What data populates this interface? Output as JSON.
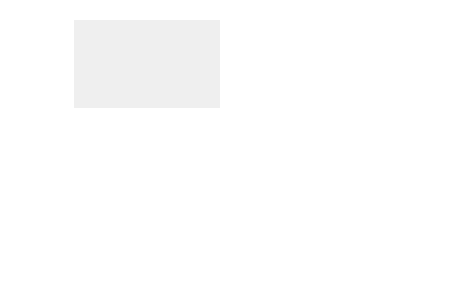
{
  "axes": {
    "y_label": "Effect size",
    "x_label": "Allele frequency",
    "y_ticks": [
      "Large",
      "Moderate",
      "Small"
    ],
    "x_ticks": [
      "Very rare",
      "Rare",
      "Low",
      "Common"
    ]
  },
  "groups": [
    {
      "title": "Mendelian loci",
      "line2": "Very low frequency",
      "line3": "Highly penetrant",
      "gene": "CFTR",
      "disease": "Cystic fibrosis"
    },
    {
      "title": "CD–CV model",
      "line2": "Common alleles",
      "line3": "Moderate effects",
      "gene": "CFH2",
      "disease": "Macular",
      "disease2": "degeneration"
    },
    {
      "title": "Goldilocks loci",
      "line2": "Low frequency",
      "line3": "Moderate effect",
      "gene": "NOD2",
      "disease": "Crohn's disease"
    },
    {
      "title": "RAME",
      "line2": "Very low frequency",
      "line3": "Variable penetrance",
      "gene": "NRG3",
      "disease": "Schizophrenia"
    },
    {
      "title": "Infinitesimal loci",
      "line2": "Common alleles",
      "line3": "Small effects",
      "gene": "PPARG",
      "disease": "Type 2 diabetes"
    }
  ],
  "colors": {
    "plot_bg": "#efefef",
    "band": "#bdbdbd",
    "ellipse": "#a9a9a9",
    "ellipse_stroke": "#8a8a8a"
  }
}
